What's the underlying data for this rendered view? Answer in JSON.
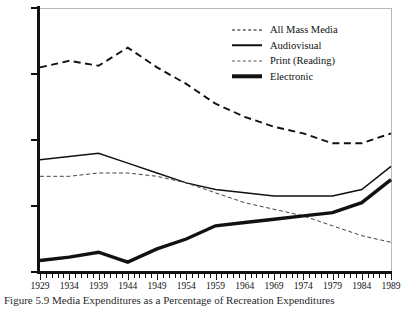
{
  "figure": {
    "caption": "Figure 5.9  Media Expenditures as a Percentage of Recreation Expenditures"
  },
  "legend": {
    "position": "top-right",
    "items": [
      {
        "label": "All Mass Media",
        "key": "dashed-line-key"
      },
      {
        "label": "Audiovisual",
        "key": "solid-line-key"
      },
      {
        "label": "Print (Reading)",
        "key": "fine-dashed-line-key"
      },
      {
        "label": "Electronic",
        "key": "thick-solid-line-key"
      }
    ]
  },
  "chart_data": {
    "type": "line",
    "title": "Figure 5.9  Media Expenditures as a Percentage of Recreation Expenditures",
    "xlabel": "",
    "ylabel": "",
    "xlim": [
      1929,
      1989
    ],
    "ylim": [
      0,
      80
    ],
    "yticks": [
      0,
      20,
      40,
      60,
      80
    ],
    "xticks": [
      1929,
      1934,
      1939,
      1944,
      1949,
      1954,
      1959,
      1964,
      1969,
      1974,
      1979,
      1984,
      1989
    ],
    "tick_interval_minor": 1,
    "grid": false,
    "x": [
      1929,
      1934,
      1939,
      1944,
      1949,
      1954,
      1959,
      1964,
      1969,
      1974,
      1979,
      1984,
      1989
    ],
    "series": [
      {
        "name": "All Mass Media",
        "style": "dashed",
        "values": [
          62,
          64,
          62.5,
          68,
          62,
          57,
          51,
          47,
          44,
          42,
          39,
          39,
          42
        ]
      },
      {
        "name": "Audiovisual",
        "style": "solid",
        "values": [
          34,
          35,
          36,
          33,
          30,
          27,
          25,
          24,
          23,
          23,
          23,
          25,
          32
        ]
      },
      {
        "name": "Print (Reading)",
        "style": "fine-dashed",
        "values": [
          29,
          29,
          30,
          30,
          29,
          27,
          24,
          21,
          19,
          17,
          14,
          11,
          9
        ]
      },
      {
        "name": "Electronic",
        "style": "thick-solid",
        "values": [
          3.5,
          4.5,
          6,
          3,
          7,
          10,
          14,
          15,
          16,
          17,
          18,
          21,
          28
        ]
      }
    ]
  }
}
